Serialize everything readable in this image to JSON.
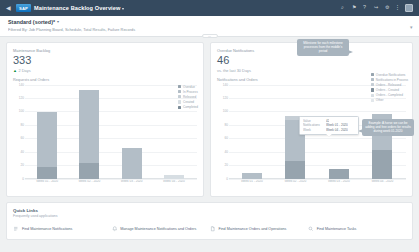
{
  "shell": {
    "back_icon": "back-arrow-icon",
    "logo_text": "SAP",
    "title": "Maintenance Backlog Overview",
    "title_caret": "▾",
    "actions": [
      {
        "name": "search-icon",
        "glyph": "⌕"
      },
      {
        "name": "notifications-icon",
        "glyph": "⚑"
      },
      {
        "name": "help-icon",
        "glyph": "?"
      },
      {
        "name": "share-icon",
        "glyph": "↪"
      },
      {
        "name": "settings-icon",
        "glyph": "⚙"
      },
      {
        "name": "overflow-icon",
        "glyph": "⋮"
      }
    ]
  },
  "filter_bar": {
    "title": "Standard (sorted)*",
    "title_caret": "▾",
    "subtitle": "Filtered By: Job Planning Board, Schedule, Total Results, Failure Records",
    "expand_icon": "▾",
    "handle_glyph": "…"
  },
  "left_card": {
    "kpi_label": "Maintenance Backlog",
    "kpi_value": "333",
    "delta_arrow": "▲",
    "delta_text": "2 Days",
    "chart_caption": "Requests and Orders"
  },
  "right_card": {
    "kpi_label": "Overdue Notifications",
    "kpi_value": "46",
    "delta_text": "vs. the last 30 Days",
    "chart_caption": "Notifications and Orders"
  },
  "chart_data": [
    {
      "id": "left",
      "type": "bar",
      "stacked": true,
      "title": "Requests and Orders",
      "xlabel": "",
      "ylabel": "",
      "ylim": [
        0,
        140
      ],
      "yticks": [
        0,
        20,
        40,
        60,
        80,
        100,
        120,
        140
      ],
      "grid": true,
      "legend_position": "right",
      "categories": [
        "Week 01 - 2020",
        "Week 02 - 2020",
        "Week 03 - 2020",
        "Week 04 - 2020"
      ],
      "series": [
        {
          "name": "Overdue",
          "color": "#97a4ae",
          "values": [
            18,
            24,
            0,
            0
          ]
        },
        {
          "name": "In Process",
          "color": "#b3bec7",
          "values": [
            82,
            108,
            46,
            0
          ]
        },
        {
          "name": "Released",
          "color": "#c5ced5",
          "values": [
            0,
            0,
            0,
            0
          ]
        },
        {
          "name": "Created",
          "color": "#d7dee3",
          "values": [
            0,
            0,
            0,
            6
          ]
        },
        {
          "name": "Completed",
          "color": "#7e8d99",
          "values": [
            0,
            0,
            0,
            0
          ]
        }
      ]
    },
    {
      "id": "right",
      "type": "bar",
      "stacked": true,
      "title": "Notifications and Orders",
      "xlabel": "",
      "ylabel": "",
      "ylim": [
        0,
        140
      ],
      "yticks": [
        0,
        20,
        40,
        60,
        80,
        100,
        120,
        140
      ],
      "grid": true,
      "legend_position": "right",
      "categories": [
        "Week 01 - 2020",
        "Week 02 - 2020",
        "Week 03 - 2020",
        "Week 04 - 2020"
      ],
      "series": [
        {
          "name": "Overdue Notifications",
          "color": "#97a4ae",
          "values": [
            0,
            26,
            14,
            42
          ]
        },
        {
          "name": "Notifications in Process",
          "color": "#b3bec7",
          "values": [
            8,
            62,
            0,
            54
          ]
        },
        {
          "name": "Orders - Released",
          "color": "#c6ced5",
          "values": [
            0,
            6,
            0,
            0
          ]
        },
        {
          "name": "Orders - Created",
          "color": "#808f9b",
          "values": [
            0,
            0,
            0,
            0
          ]
        },
        {
          "name": "Orders - Completed",
          "color": "#d7dee3",
          "values": [
            0,
            0,
            0,
            0
          ]
        },
        {
          "name": "Other",
          "color": "#e3e8ec",
          "values": [
            0,
            0,
            0,
            0
          ]
        }
      ]
    }
  ],
  "callouts": [
    {
      "name": "callout-top",
      "text": "Milestone for each milestone processes from the middle's period"
    },
    {
      "name": "callout-bottom",
      "text": "Example: A horse we can be adding and free orders for results during week 01-2020"
    }
  ],
  "tooltip": {
    "rows": [
      {
        "key": "Week",
        "value": "Week 04 - 2020"
      },
      {
        "key": "Notifications",
        "value": "Week 01 - 2020"
      },
      {
        "key": "Value",
        "value": "42"
      }
    ]
  },
  "quick_links": {
    "title": "Quick Links",
    "subtitle": "Frequently used applications",
    "items": [
      {
        "icon": "list-icon",
        "label": "Find Maintenance Notifications"
      },
      {
        "icon": "bell-icon",
        "label": "Manage Maintenance Notifications and Orders"
      },
      {
        "icon": "document-icon",
        "label": "Find Maintenance Orders and Operations"
      },
      {
        "icon": "search-icon",
        "label": "Find Maintenance Tasks"
      }
    ]
  }
}
